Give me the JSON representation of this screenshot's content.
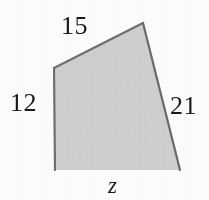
{
  "figure": {
    "kind": "geometry-diagram",
    "background_color": "#fdfdfd",
    "shape": {
      "name": "quadrilateral",
      "fill_color": "#d6d6d6",
      "stroke_color": "#6a6a6a",
      "stroke_width": 2,
      "vertices": [
        {
          "name": "top-right",
          "x": 143,
          "y": 23
        },
        {
          "name": "left",
          "x": 54,
          "y": 68
        },
        {
          "name": "bottom-left",
          "x": 55,
          "y": 170
        },
        {
          "name": "bottom-right",
          "x": 180,
          "y": 170
        }
      ]
    },
    "side_labels": {
      "top": "15",
      "left": "12",
      "right": "21",
      "bottom": "z"
    }
  }
}
